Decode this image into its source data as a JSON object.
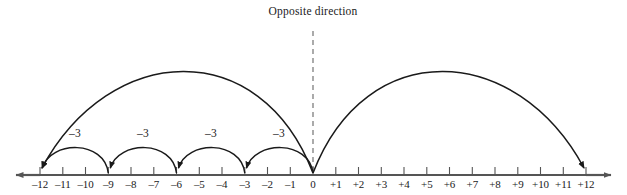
{
  "figure": {
    "title": "Opposite direction",
    "axis": {
      "min": -12,
      "max": 12,
      "tick_labels": [
        "–12",
        "–11",
        "–10",
        "–9",
        "–8",
        "–7",
        "–6",
        "–5",
        "–4",
        "–3",
        "–2",
        "–1",
        "0",
        "+1",
        "+2",
        "+3",
        "+4",
        "+5",
        "+6",
        "+7",
        "+8",
        "+9",
        "+10",
        "+11",
        "+12"
      ],
      "left_arrow": true,
      "right_arrow": true,
      "line_color": "#555555"
    },
    "small_arcs": [
      {
        "from": 0,
        "to": -3,
        "label": "–3"
      },
      {
        "from": -3,
        "to": -6,
        "label": "–3"
      },
      {
        "from": -6,
        "to": -9,
        "label": "–3"
      },
      {
        "from": -9,
        "to": -12,
        "label": "–3"
      }
    ],
    "big_arcs": [
      {
        "from": 0,
        "to": -12,
        "label": ""
      },
      {
        "from": 0,
        "to": 12,
        "label": ""
      }
    ],
    "dashed_divider": {
      "at": 0,
      "label": ""
    },
    "stroke_color": "#1a1a1a",
    "dash_color": "#666666"
  }
}
